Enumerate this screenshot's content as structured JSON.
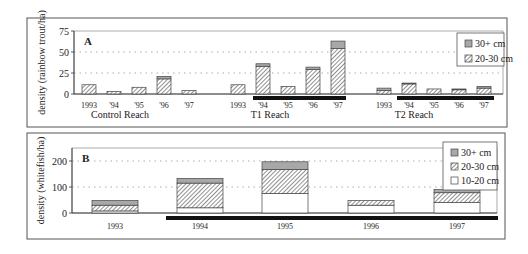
{
  "colors": {
    "frame": "#555555",
    "bar_edge": "#444444",
    "solid_30plus": "#a8a8a8",
    "hatch": "#555555",
    "fill_10_20": "#ffffff",
    "treatment_bar": "#111111",
    "grid": "#999999"
  },
  "chart_data": [
    {
      "type": "bar",
      "stacked": true,
      "panel_label": "A",
      "ylabel": "density (rainbow trout/ha)",
      "ylim": [
        0,
        75
      ],
      "yticks": [
        0,
        25,
        50,
        75
      ],
      "grid": "dotted horizontal at 25 and 50",
      "legend": [
        "30+ cm",
        "20-30 cm"
      ],
      "legend_position": "upper right",
      "groups": [
        {
          "name": "Control Reach",
          "categories": [
            "1993",
            "'94",
            "'95",
            "'96",
            "'97"
          ],
          "treatment_years": [],
          "series": [
            {
              "name": "20-30 cm",
              "values": [
                11,
                3,
                8,
                18,
                4
              ]
            },
            {
              "name": "30+ cm",
              "values": [
                0,
                0,
                0,
                3,
                0
              ]
            }
          ]
        },
        {
          "name": "T1 Reach",
          "categories": [
            "1993",
            "'94",
            "'95",
            "'96",
            "'97"
          ],
          "treatment_years": [
            "'94",
            "'95",
            "'96",
            "'97"
          ],
          "series": [
            {
              "name": "20-30 cm",
              "values": [
                11,
                33,
                9,
                29,
                54
              ]
            },
            {
              "name": "30+ cm",
              "values": [
                0,
                3,
                0,
                3,
                9
              ]
            }
          ]
        },
        {
          "name": "T2 Reach",
          "categories": [
            "1993",
            "'94",
            "'95",
            "'96",
            "'97"
          ],
          "treatment_years": [
            "'94",
            "'95",
            "'96",
            "'97"
          ],
          "series": [
            {
              "name": "20-30 cm",
              "values": [
                4,
                12,
                6,
                5,
                7
              ]
            },
            {
              "name": "30+ cm",
              "values": [
                3,
                1,
                0,
                1,
                2
              ]
            }
          ]
        }
      ]
    },
    {
      "type": "bar",
      "stacked": true,
      "panel_label": "B",
      "ylabel": "density (whitefish/ha)",
      "ylim": [
        0,
        250
      ],
      "yticks": [
        0,
        100,
        200
      ],
      "grid": "dotted horizontal at 100 and 200",
      "legend": [
        "30+ cm",
        "20-30 cm",
        "10-20 cm"
      ],
      "legend_position": "upper right",
      "categories": [
        "1993",
        "1994",
        "1995",
        "1996",
        "1997"
      ],
      "treatment_years": [
        "1994",
        "1995",
        "1996",
        "1997"
      ],
      "series": [
        {
          "name": "10-20 cm",
          "values": [
            8,
            20,
            75,
            30,
            40
          ]
        },
        {
          "name": "20-30 cm",
          "values": [
            22,
            95,
            92,
            18,
            38
          ]
        },
        {
          "name": "30+ cm",
          "values": [
            18,
            18,
            30,
            0,
            12
          ]
        }
      ]
    }
  ]
}
